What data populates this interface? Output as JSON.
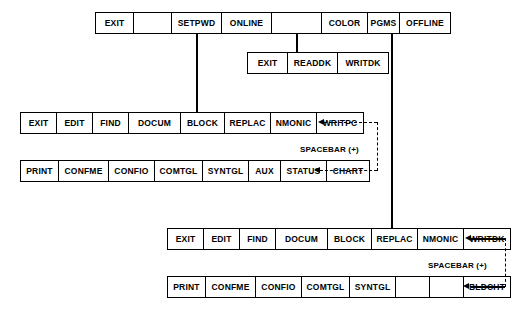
{
  "diagram": {
    "colors": {
      "line": "#000000",
      "background": "#ffffff",
      "text": "#000000"
    },
    "rows": [
      {
        "id": "row-top-main",
        "name": "main-menu-row",
        "cells": [
          {
            "label": "EXIT",
            "width": 38
          },
          {
            "label": "",
            "width": 38
          },
          {
            "label": "SETPWD",
            "width": 50
          },
          {
            "label": "ONLINE",
            "width": 50
          },
          {
            "label": "",
            "width": 50
          },
          {
            "label": "COLOR",
            "width": 46
          },
          {
            "label": "PGMS",
            "width": 32
          },
          {
            "label": "OFFLINE",
            "width": 50
          }
        ]
      },
      {
        "id": "row-color",
        "name": "color-submenu-row",
        "cells": [
          {
            "label": "EXIT",
            "width": 40
          },
          {
            "label": "READDK",
            "width": 50
          },
          {
            "label": "WRITDK",
            "width": 50
          }
        ]
      },
      {
        "id": "row-online-edit",
        "name": "online-edit-menu-row",
        "cells": [
          {
            "label": "EXIT",
            "width": 36
          },
          {
            "label": "EDIT",
            "width": 36
          },
          {
            "label": "FIND",
            "width": 36
          },
          {
            "label": "DOCUM",
            "width": 52
          },
          {
            "label": "BLOCK",
            "width": 44
          },
          {
            "label": "REPLAC",
            "width": 46
          },
          {
            "label": "NMONIC",
            "width": 46
          },
          {
            "label": "WRITPC",
            "width": 46
          }
        ]
      },
      {
        "id": "row-online-print",
        "name": "online-print-menu-row",
        "cells": [
          {
            "label": "PRINT",
            "width": 38
          },
          {
            "label": "CONFME",
            "width": 50
          },
          {
            "label": "CONFIO",
            "width": 46
          },
          {
            "label": "COMTGL",
            "width": 48
          },
          {
            "label": "SYNTGL",
            "width": 46
          },
          {
            "label": "AUX",
            "width": 32
          },
          {
            "label": "STATUS",
            "width": 46
          },
          {
            "label": "CHART",
            "width": 42
          }
        ]
      },
      {
        "id": "row-offline-edit",
        "name": "offline-edit-menu-row",
        "cells": [
          {
            "label": "EXIT",
            "width": 36
          },
          {
            "label": "EDIT",
            "width": 36
          },
          {
            "label": "FIND",
            "width": 36
          },
          {
            "label": "DOCUM",
            "width": 52
          },
          {
            "label": "BLOCK",
            "width": 44
          },
          {
            "label": "REPLAC",
            "width": 46
          },
          {
            "label": "NMONIC",
            "width": 46
          },
          {
            "label": "WRITDK",
            "width": 46
          }
        ]
      },
      {
        "id": "row-offline-print",
        "name": "offline-print-menu-row",
        "cells": [
          {
            "label": "PRINT",
            "width": 38
          },
          {
            "label": "CONFME",
            "width": 50
          },
          {
            "label": "CONFIO",
            "width": 46
          },
          {
            "label": "COMTGL",
            "width": 48
          },
          {
            "label": "SYNTGL",
            "width": 46
          },
          {
            "label": "",
            "width": 34
          },
          {
            "label": "",
            "width": 34
          },
          {
            "label": "BLDCHT",
            "width": 46
          }
        ]
      }
    ],
    "annotations": {
      "spacebar_upper": "SPACEBAR (+)",
      "spacebar_lower": "SPACEBAR (+)"
    }
  }
}
